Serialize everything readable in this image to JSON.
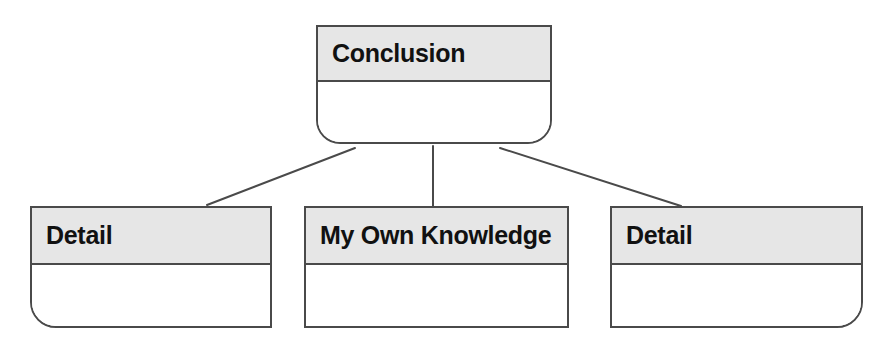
{
  "diagram": {
    "type": "hierarchy-tree",
    "background_color": "#ffffff",
    "line_color": "#4a4a4a",
    "header_fill_color": "#e6e6e6",
    "body_fill_color": "#ffffff",
    "text_color": "#111111",
    "root": {
      "id": "conclusion",
      "title": "Conclusion",
      "body_text": "",
      "shape": "rounded-bottom-rectangle"
    },
    "children": [
      {
        "id": "detail-left",
        "title": "Detail",
        "body_text": "",
        "shape": "rounded-bottom-left-rectangle"
      },
      {
        "id": "my-own-knowledge",
        "title": "My Own Knowledge",
        "body_text": "",
        "shape": "rectangle"
      },
      {
        "id": "detail-right",
        "title": "Detail",
        "body_text": "",
        "shape": "rounded-bottom-right-rectangle"
      }
    ],
    "connectors": [
      {
        "id": "connector-left",
        "from": "conclusion",
        "to": "detail-left",
        "style": "diagonal-line"
      },
      {
        "id": "connector-center",
        "from": "conclusion",
        "to": "my-own-knowledge",
        "style": "vertical-line"
      },
      {
        "id": "connector-right",
        "from": "conclusion",
        "to": "detail-right",
        "style": "diagonal-line"
      }
    ]
  }
}
